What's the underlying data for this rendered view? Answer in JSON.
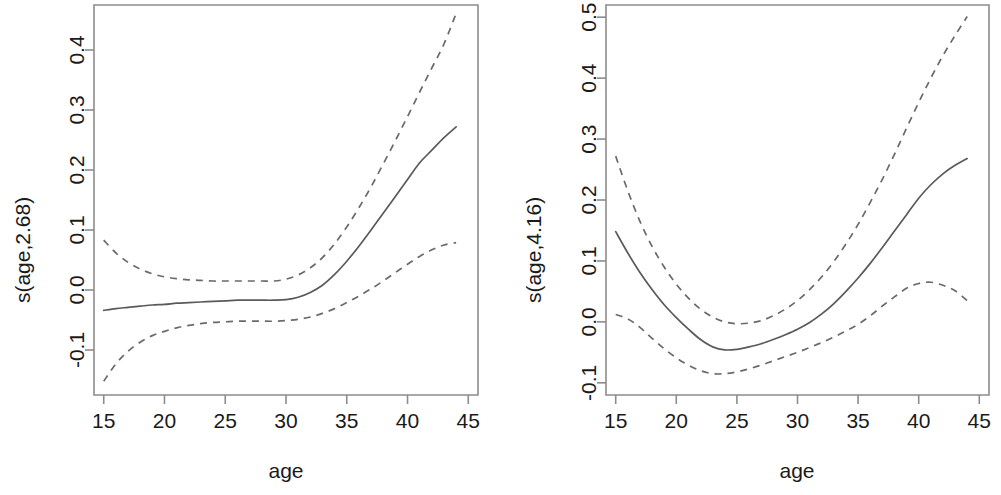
{
  "figure": {
    "title": "",
    "panel_count": 2
  },
  "chart_data": [
    {
      "type": "line",
      "panel": "left",
      "title": "",
      "xlabel": "age",
      "ylabel": "s(age,2.68)",
      "edf": "2.68",
      "xlim": [
        14.2,
        45.8
      ],
      "ylim": [
        -0.175,
        0.475
      ],
      "xticks": [
        15,
        20,
        25,
        30,
        35,
        40,
        45
      ],
      "xtick_labels": [
        "15",
        "20",
        "25",
        "30",
        "35",
        "40",
        "45"
      ],
      "yticks": [
        -0.1,
        0.0,
        0.1,
        0.2,
        0.3,
        0.4
      ],
      "ytick_labels": [
        "-0.1",
        "0.0",
        "0.1",
        "0.2",
        "0.3",
        "0.4"
      ],
      "grid": false,
      "legend": "none",
      "x": [
        15,
        16,
        17,
        18,
        19,
        20,
        21,
        22,
        23,
        24,
        25,
        26,
        27,
        28,
        29,
        30,
        31,
        32,
        33,
        34,
        35,
        36,
        37,
        38,
        39,
        40,
        41,
        42,
        43,
        44
      ],
      "series": [
        {
          "name": "fit",
          "style": "solid",
          "values": [
            -0.034,
            -0.031,
            -0.029,
            -0.027,
            -0.025,
            -0.024,
            -0.022,
            -0.021,
            -0.02,
            -0.019,
            -0.018,
            -0.017,
            -0.017,
            -0.017,
            -0.017,
            -0.016,
            -0.012,
            -0.004,
            0.008,
            0.026,
            0.048,
            0.073,
            0.1,
            0.128,
            0.156,
            0.184,
            0.212,
            0.233,
            0.254,
            0.272
          ]
        },
        {
          "name": "upper_ci",
          "style": "dashed",
          "values": [
            0.083,
            0.062,
            0.046,
            0.035,
            0.027,
            0.022,
            0.019,
            0.017,
            0.016,
            0.015,
            0.015,
            0.015,
            0.015,
            0.015,
            0.015,
            0.018,
            0.025,
            0.037,
            0.054,
            0.077,
            0.105,
            0.137,
            0.172,
            0.21,
            0.249,
            0.289,
            0.33,
            0.37,
            0.41,
            0.461
          ]
        },
        {
          "name": "lower_ci",
          "style": "dashed",
          "values": [
            -0.152,
            -0.123,
            -0.102,
            -0.087,
            -0.076,
            -0.069,
            -0.063,
            -0.059,
            -0.056,
            -0.054,
            -0.053,
            -0.052,
            -0.052,
            -0.052,
            -0.052,
            -0.051,
            -0.049,
            -0.045,
            -0.039,
            -0.031,
            -0.021,
            -0.01,
            0.002,
            0.015,
            0.029,
            0.043,
            0.056,
            0.067,
            0.075,
            0.079
          ]
        }
      ]
    },
    {
      "type": "line",
      "panel": "right",
      "title": "",
      "xlabel": "age",
      "ylabel": "s(age,4.16)",
      "edf": "4.16",
      "xlim": [
        14.2,
        45.8
      ],
      "ylim": [
        -0.12,
        0.52
      ],
      "xticks": [
        15,
        20,
        25,
        30,
        35,
        40,
        45
      ],
      "xtick_labels": [
        "15",
        "20",
        "25",
        "30",
        "35",
        "40",
        "45"
      ],
      "yticks": [
        -0.1,
        0.0,
        0.1,
        0.2,
        0.3,
        0.4,
        0.5
      ],
      "ytick_labels": [
        "-0.1",
        "0.0",
        "0.1",
        "0.2",
        "0.3",
        "0.4",
        "0.5"
      ],
      "grid": false,
      "legend": "none",
      "x": [
        15,
        16,
        17,
        18,
        19,
        20,
        21,
        22,
        23,
        24,
        25,
        26,
        27,
        28,
        29,
        30,
        31,
        32,
        33,
        34,
        35,
        36,
        37,
        38,
        39,
        40,
        41,
        42,
        43,
        44
      ],
      "series": [
        {
          "name": "fit",
          "style": "solid",
          "values": [
            0.148,
            0.113,
            0.081,
            0.053,
            0.028,
            0.007,
            -0.012,
            -0.029,
            -0.041,
            -0.046,
            -0.045,
            -0.041,
            -0.036,
            -0.029,
            -0.021,
            -0.012,
            -0.001,
            0.013,
            0.03,
            0.05,
            0.072,
            0.096,
            0.122,
            0.149,
            0.176,
            0.203,
            0.225,
            0.243,
            0.257,
            0.268
          ]
        },
        {
          "name": "upper_ci",
          "style": "dashed",
          "values": [
            0.272,
            0.215,
            0.165,
            0.124,
            0.09,
            0.062,
            0.039,
            0.021,
            0.008,
            0.0,
            -0.003,
            -0.002,
            0.002,
            0.01,
            0.021,
            0.035,
            0.053,
            0.074,
            0.099,
            0.128,
            0.16,
            0.196,
            0.234,
            0.275,
            0.318,
            0.36,
            0.4,
            0.437,
            0.47,
            0.501
          ]
        },
        {
          "name": "lower_ci",
          "style": "dashed",
          "values": [
            0.012,
            0.005,
            -0.009,
            -0.027,
            -0.044,
            -0.059,
            -0.071,
            -0.08,
            -0.085,
            -0.085,
            -0.082,
            -0.077,
            -0.071,
            -0.064,
            -0.057,
            -0.05,
            -0.042,
            -0.034,
            -0.025,
            -0.015,
            -0.004,
            0.01,
            0.026,
            0.041,
            0.055,
            0.063,
            0.065,
            0.06,
            0.051,
            0.035
          ]
        }
      ]
    }
  ],
  "left_panel": {
    "ylabel": "s(age,2.68)",
    "xlabel": "age",
    "yticks": [
      "-0.1",
      "0.0",
      "0.1",
      "0.2",
      "0.3",
      "0.4"
    ],
    "xticks": [
      "15",
      "20",
      "25",
      "30",
      "35",
      "40",
      "45"
    ]
  },
  "right_panel": {
    "ylabel": "s(age,4.16)",
    "xlabel": "age",
    "yticks": [
      "-0.1",
      "0.0",
      "0.1",
      "0.2",
      "0.3",
      "0.4",
      "0.5"
    ],
    "xticks": [
      "15",
      "20",
      "25",
      "30",
      "35",
      "40",
      "45"
    ]
  },
  "colors": {
    "fit_line": "#5a5a5a",
    "ci_line": "#6a6a6a",
    "axis": "#8c8c8c",
    "text": "#1a1a1a",
    "background": "#ffffff"
  }
}
